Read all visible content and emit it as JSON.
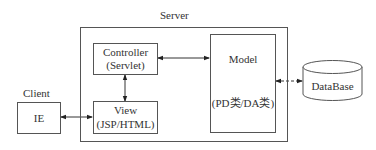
{
  "diagram": {
    "server": {
      "label": "Server"
    },
    "client": {
      "label": "Client"
    },
    "nodes": {
      "ie": {
        "label": "IE"
      },
      "controller": {
        "line1": "Controller",
        "line2": "(Servlet)"
      },
      "view": {
        "line1": "View",
        "line2": "(JSP/HTML)"
      },
      "model": {
        "line1": "Model",
        "line2": "(PD类/DA类)"
      },
      "database": {
        "label": "DataBase"
      }
    },
    "edges": [
      {
        "from": "ie",
        "to": "view",
        "type": "bidirectional"
      },
      {
        "from": "controller",
        "to": "view",
        "type": "bidirectional"
      },
      {
        "from": "controller",
        "to": "model",
        "type": "bidirectional"
      },
      {
        "from": "model",
        "to": "database",
        "type": "bidirectional"
      }
    ]
  }
}
